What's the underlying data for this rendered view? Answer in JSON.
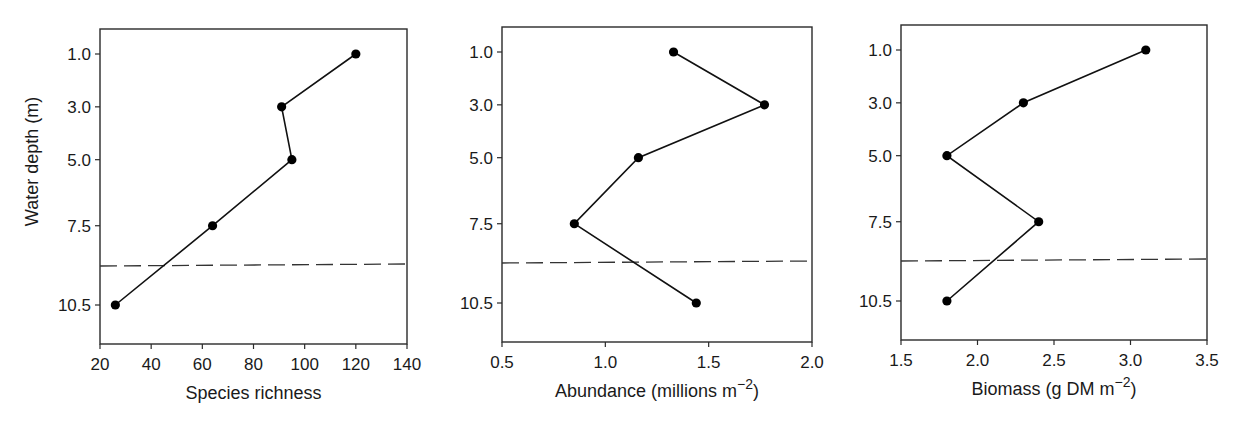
{
  "chart_data": [
    {
      "type": "line",
      "title": "",
      "xlabel": "Species richness",
      "xlabel_sup": "",
      "xlabel_tail": "",
      "ylabel": "Water depth (m)",
      "xlim": [
        20,
        140
      ],
      "xticks": [
        20,
        40,
        60,
        80,
        100,
        120,
        140
      ],
      "xtick_labels": [
        "20",
        "40",
        "60",
        "80",
        "100",
        "120",
        "140"
      ],
      "ylim_inverted": true,
      "yticks": [
        1.0,
        3.0,
        5.0,
        7.5,
        10.5
      ],
      "ytick_labels": [
        "1.0",
        "3.0",
        "5.0",
        "7.5",
        "10.5"
      ],
      "y": [
        1.0,
        3.0,
        5.0,
        7.5,
        10.5
      ],
      "x": [
        120,
        91,
        95,
        64,
        26
      ],
      "reference_line_depth": 9.0,
      "grid": false,
      "legend": null
    },
    {
      "type": "line",
      "title": "",
      "xlabel": "Abundance (millions m",
      "xlabel_sup": "−2",
      "xlabel_tail": ")",
      "ylabel": "",
      "xlim": [
        0.5,
        2.0
      ],
      "xticks": [
        0.5,
        1.0,
        1.5,
        2.0
      ],
      "xtick_labels": [
        "0.5",
        "1.0",
        "1.5",
        "2.0"
      ],
      "ylim_inverted": true,
      "yticks": [
        1.0,
        3.0,
        5.0,
        7.5,
        10.5
      ],
      "ytick_labels": [
        "1.0",
        "3.0",
        "5.0",
        "7.5",
        "10.5"
      ],
      "y": [
        1.0,
        3.0,
        5.0,
        7.5,
        10.5
      ],
      "x": [
        1.33,
        1.77,
        1.16,
        0.85,
        1.44
      ],
      "reference_line_depth": 9.0,
      "grid": false,
      "legend": null
    },
    {
      "type": "line",
      "title": "",
      "xlabel": "Biomass (g DM m",
      "xlabel_sup": "−2",
      "xlabel_tail": ")",
      "ylabel": "",
      "xlim": [
        1.5,
        3.5
      ],
      "xticks": [
        1.5,
        2.0,
        2.5,
        3.0,
        3.5
      ],
      "xtick_labels": [
        "1.5",
        "2.0",
        "2.5",
        "3.0",
        "3.5"
      ],
      "ylim_inverted": true,
      "yticks": [
        1.0,
        3.0,
        5.0,
        7.5,
        10.5
      ],
      "ytick_labels": [
        "1.0",
        "3.0",
        "5.0",
        "7.5",
        "10.5"
      ],
      "y": [
        1.0,
        3.0,
        5.0,
        7.5,
        10.5
      ],
      "x": [
        3.1,
        2.3,
        1.8,
        2.4,
        1.8
      ],
      "reference_line_depth": 9.0,
      "grid": false,
      "legend": null
    }
  ]
}
